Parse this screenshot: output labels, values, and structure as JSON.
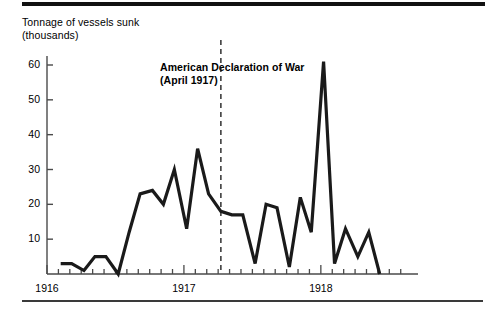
{
  "figure": {
    "axis_title": "Tonnage of vessels sunk\n(thousands)",
    "annotation": "American Declaration of War\n(April 1917)",
    "annotation_x_value": 1917.27,
    "line_color": "#1a1a1a",
    "axis_color": "#4a4a4a",
    "rule_color": "#111111"
  },
  "chart_data": {
    "type": "line",
    "title": "",
    "subtitle": "",
    "xlabel": "",
    "ylabel": "Tonnage of vessels sunk (thousands)",
    "grid": false,
    "legend": "none",
    "xlim": [
      1916.0,
      1918.6
    ],
    "ylim": [
      0,
      66
    ],
    "ytick_labels": [
      "10",
      "20",
      "30",
      "40",
      "50",
      "60"
    ],
    "ytick_values": [
      10,
      20,
      30,
      40,
      50,
      60
    ],
    "xtick_labels": [
      "1916",
      "1917",
      "1918"
    ],
    "xtick_values": [
      1916,
      1917,
      1918
    ],
    "x_minor_tick_interval_months": 1,
    "annotations": [
      {
        "text": "American Declaration of War (April 1917)",
        "x": 1917.27,
        "style": "dashed-vertical-line"
      }
    ],
    "series": [
      {
        "name": "Tonnage of vessels sunk (thousands)",
        "x": [
          1916.1,
          1916.18,
          1916.27,
          1916.35,
          1916.43,
          1916.52,
          1916.6,
          1916.68,
          1916.77,
          1916.85,
          1916.93,
          1917.02,
          1917.1,
          1917.18,
          1917.27,
          1917.35,
          1917.43,
          1917.52,
          1917.6,
          1917.68,
          1917.77,
          1917.85,
          1917.93,
          1918.02,
          1918.1,
          1918.18,
          1918.27,
          1918.35,
          1918.43
        ],
        "values": [
          3,
          3,
          1,
          5,
          5,
          0,
          12,
          23,
          24,
          20,
          30,
          13,
          36,
          23,
          18,
          17,
          17,
          3,
          20,
          19,
          2,
          22,
          12,
          61,
          3,
          13,
          5,
          12,
          0
        ]
      }
    ]
  }
}
